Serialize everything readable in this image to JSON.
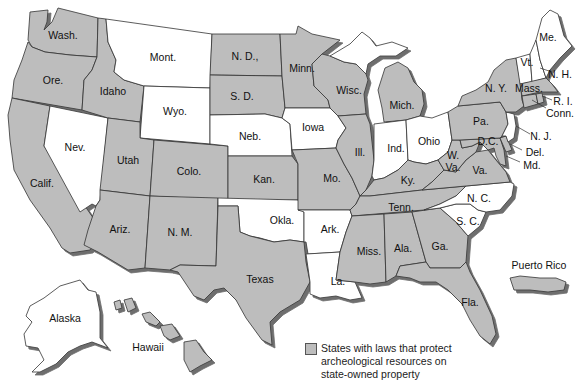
{
  "title": "States with laws that protect archeological resources on state-owned property",
  "colors": {
    "protected": "#bdbdbd",
    "not_protected": "#ffffff",
    "shadow": "#777777",
    "border": "#333333"
  },
  "legend": {
    "swatch_label": "States with laws that protect archeological resources on state-owned property",
    "line1": "States with laws that protect",
    "line2": "archeological resources on",
    "line3": "state-owned property"
  },
  "states": {
    "wash": {
      "label": "Wash.",
      "protected": true
    },
    "ore": {
      "label": "Ore.",
      "protected": true
    },
    "calif": {
      "label": "Calif.",
      "protected": true
    },
    "nev": {
      "label": "Nev.",
      "protected": false
    },
    "idaho": {
      "label": "Idaho",
      "protected": true
    },
    "mont": {
      "label": "Mont.",
      "protected": false
    },
    "wyo": {
      "label": "Wyo.",
      "protected": false
    },
    "utah": {
      "label": "Utah",
      "protected": true
    },
    "colo": {
      "label": "Colo.",
      "protected": true
    },
    "ariz": {
      "label": "Ariz.",
      "protected": true
    },
    "nm": {
      "label": "N. M.",
      "protected": true
    },
    "nd": {
      "label": "N. D.,",
      "protected": true
    },
    "sd": {
      "label": "S. D.",
      "protected": true
    },
    "neb": {
      "label": "Neb.",
      "protected": false
    },
    "kan": {
      "label": "Kan.",
      "protected": true
    },
    "okla": {
      "label": "Okla.",
      "protected": false
    },
    "texas": {
      "label": "Texas",
      "protected": true
    },
    "minn": {
      "label": "Minn.",
      "protected": true
    },
    "iowa": {
      "label": "Iowa",
      "protected": false
    },
    "mo": {
      "label": "Mo.",
      "protected": true
    },
    "ark": {
      "label": "Ark.",
      "protected": false
    },
    "la": {
      "label": "La.",
      "protected": false
    },
    "wisc": {
      "label": "Wisc.",
      "protected": true
    },
    "ill": {
      "label": "Ill.",
      "protected": true
    },
    "mich": {
      "label": "Mich.",
      "protected": true
    },
    "ind": {
      "label": "Ind.",
      "protected": false
    },
    "ohio": {
      "label": "Ohio",
      "protected": false
    },
    "ky": {
      "label": "Ky.",
      "protected": true
    },
    "tenn": {
      "label": "Tenn.",
      "protected": true
    },
    "miss": {
      "label": "Miss.",
      "protected": true
    },
    "ala": {
      "label": "Ala.",
      "protected": true
    },
    "ga": {
      "label": "Ga.",
      "protected": true
    },
    "fla": {
      "label": "Fla.",
      "protected": true
    },
    "sc": {
      "label": "S. C.",
      "protected": false
    },
    "nc": {
      "label": "N. C.",
      "protected": false
    },
    "va": {
      "label": "Va.",
      "protected": true
    },
    "wva": {
      "label": "W. Va.",
      "protected": true
    },
    "wva_line1": {
      "label": "W."
    },
    "wva_line2": {
      "label": "Va."
    },
    "dc": {
      "label": "D.C.",
      "protected": true
    },
    "md": {
      "label": "Md.",
      "protected": true
    },
    "del": {
      "label": "Del.",
      "protected": true
    },
    "nj": {
      "label": "N. J.",
      "protected": false
    },
    "pa": {
      "label": "Pa.",
      "protected": true
    },
    "ny": {
      "label": "N. Y.",
      "protected": true
    },
    "vt": {
      "label": "Vt.",
      "protected": false
    },
    "nh": {
      "label": "N. H.",
      "protected": false
    },
    "me": {
      "label": "Me.",
      "protected": false
    },
    "mass": {
      "label": "Mass.",
      "protected": true
    },
    "ri": {
      "label": "R. I.",
      "protected": true
    },
    "conn": {
      "label": "Conn.",
      "protected": true
    },
    "alaska": {
      "label": "Alaska",
      "protected": false
    },
    "hawaii": {
      "label": "Hawaii",
      "protected": true
    },
    "puerto_rico": {
      "label": "Puerto Rico",
      "protected": true
    }
  }
}
